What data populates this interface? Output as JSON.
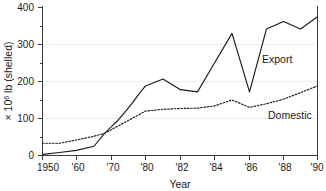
{
  "chart_data": {
    "type": "line",
    "title": "",
    "xlabel": "Year",
    "ylabel": "× 10⁶ lb (shelled)",
    "ylabel_parts": {
      "prefix": "× 10",
      "exponent": "6",
      "suffix": " lb (shelled)"
    },
    "xlim": [
      1950,
      1990
    ],
    "ylim": [
      0,
      400
    ],
    "grid": "horizontal-faint",
    "legend_position": "inline-labels",
    "x_axis_scale": "piecewise (decades 1950-1980, then 2-year steps to 1990)",
    "y_ticks": [
      0,
      100,
      200,
      300,
      400
    ],
    "y_minor_ticks": [
      50,
      150,
      250,
      350
    ],
    "x_ticks": [
      1950,
      1960,
      1970,
      1980,
      1982,
      1984,
      1986,
      1988,
      1990
    ],
    "x_tick_labels": [
      "1950",
      "'60",
      "'70",
      "'80",
      "'82",
      "'84",
      "'86",
      "'88",
      "'90"
    ],
    "series": [
      {
        "name": "Export",
        "style": "solid",
        "label": "Export",
        "x": [
          1950,
          1955,
          1960,
          1965,
          1968,
          1970,
          1972,
          1974,
          1976,
          1978,
          1980,
          1981,
          1982,
          1983,
          1984,
          1985,
          1986,
          1987,
          1988,
          1989,
          1990
        ],
        "values": [
          3,
          8,
          14,
          25,
          60,
          78,
          96,
          118,
          140,
          165,
          188,
          207,
          178,
          172,
          250,
          330,
          172,
          342,
          362,
          342,
          375
        ]
      },
      {
        "name": "Domestic",
        "style": "dotted",
        "label": "Domestic",
        "x": [
          1950,
          1955,
          1960,
          1965,
          1968,
          1970,
          1972,
          1974,
          1976,
          1978,
          1980,
          1981,
          1982,
          1983,
          1984,
          1985,
          1986,
          1987,
          1988,
          1989,
          1990
        ],
        "values": [
          33,
          33,
          42,
          52,
          60,
          70,
          80,
          90,
          100,
          110,
          120,
          125,
          127,
          128,
          134,
          150,
          130,
          140,
          152,
          170,
          188
        ]
      }
    ]
  },
  "labels": {
    "export": "Export",
    "domestic": "Domestic",
    "year_axis": "Year",
    "y_axis_prefix": "× 10",
    "y_axis_exponent": "6",
    "y_axis_suffix": " lb (shelled)"
  },
  "ytick_labels": {
    "t0": "0",
    "t100": "100",
    "t200": "200",
    "t300": "300",
    "t400": "400"
  },
  "xtick_labels": {
    "t1950": "1950",
    "t1960": "'60",
    "t1970": "'70",
    "t1980": "'80",
    "t1982": "'82",
    "t1984": "'84",
    "t1986": "'86",
    "t1988": "'88",
    "t1990": "'90"
  },
  "colors": {
    "line": "#1a1a1a",
    "axis": "#3a3a3a",
    "grid": "#ededed",
    "background": "#ffffff"
  }
}
